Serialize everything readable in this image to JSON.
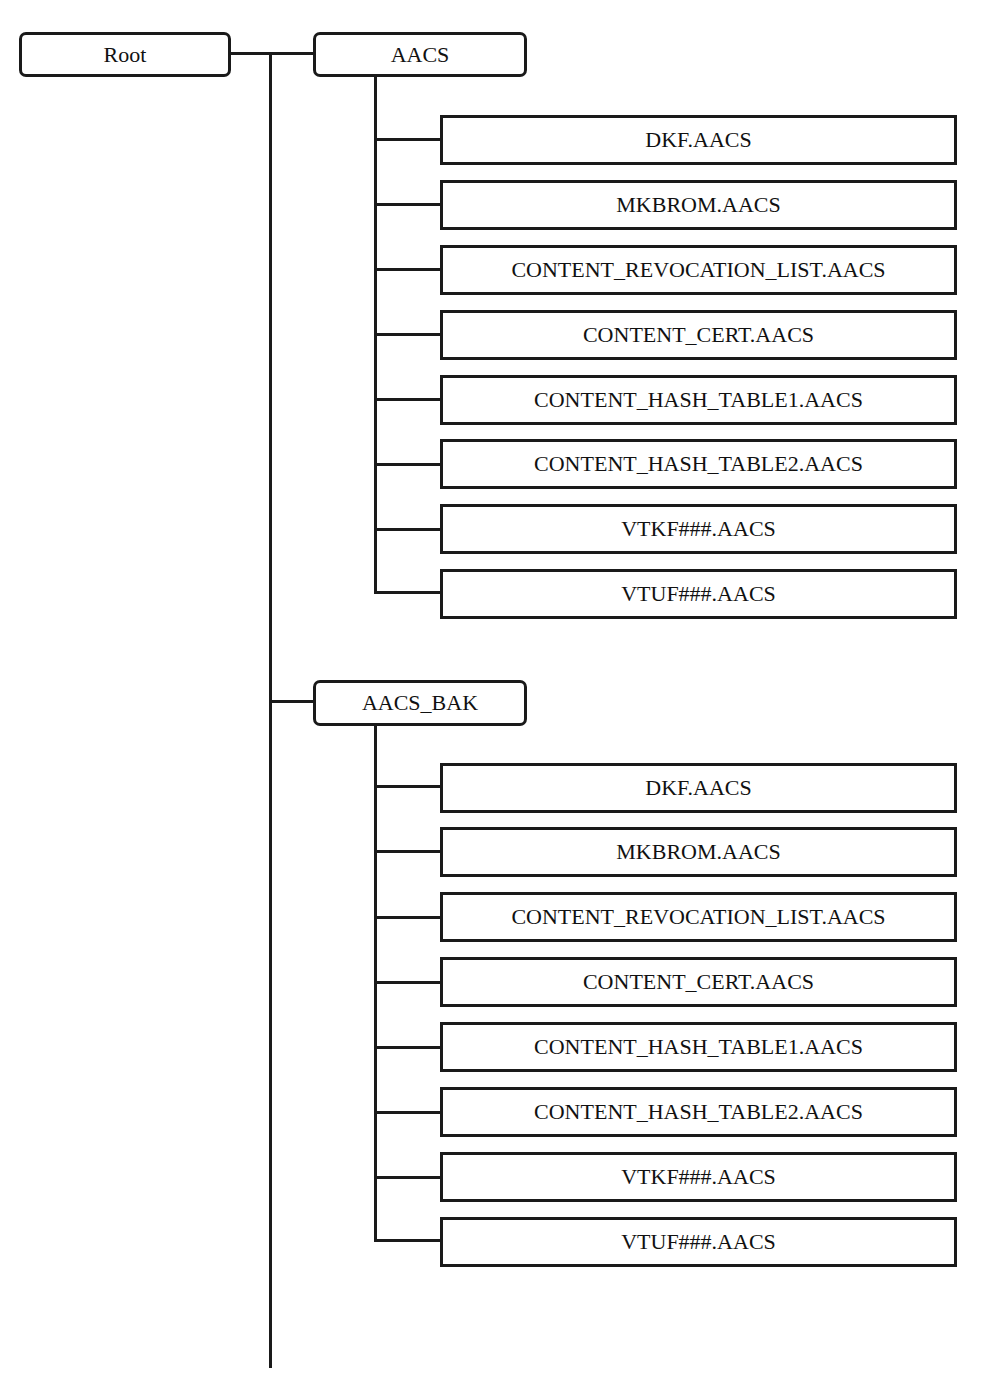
{
  "diagram": {
    "type": "directory-tree",
    "root": {
      "label": "Root"
    },
    "folders": [
      {
        "label": "AACS",
        "files": [
          "DKF.AACS",
          "MKBROM.AACS",
          "CONTENT_REVOCATION_LIST.AACS",
          "CONTENT_CERT.AACS",
          "CONTENT_HASH_TABLE1.AACS",
          "CONTENT_HASH_TABLE2.AACS",
          "VTKF###.AACS",
          "VTUF###.AACS"
        ]
      },
      {
        "label": "AACS_BAK",
        "files": [
          "DKF.AACS",
          "MKBROM.AACS",
          "CONTENT_REVOCATION_LIST.AACS",
          "CONTENT_CERT.AACS",
          "CONTENT_HASH_TABLE1.AACS",
          "CONTENT_HASH_TABLE2.AACS",
          "VTKF###.AACS",
          "VTUF###.AACS"
        ]
      }
    ]
  },
  "colors": {
    "stroke": "#1a1a1a",
    "background": "#ffffff"
  }
}
